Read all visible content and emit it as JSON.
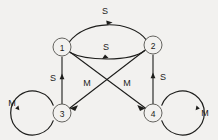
{
  "diagram": {
    "type": "directed-state-transition-graph",
    "background_color": "#f2f1ef",
    "line_color": "#1d1d1b",
    "node_fill_color": "#f2f1ef",
    "node_stroke_color": "#55544f",
    "nodes": [
      {
        "id": "1",
        "label": "1",
        "cx": 62,
        "cy": 47,
        "r": 9
      },
      {
        "id": "2",
        "label": "2",
        "cx": 153,
        "cy": 45,
        "r": 9
      },
      {
        "id": "3",
        "label": "3",
        "cx": 62,
        "cy": 113,
        "r": 9
      },
      {
        "id": "4",
        "label": "4",
        "cx": 153,
        "cy": 113,
        "r": 9
      }
    ],
    "edges": [
      {
        "id": "e-1-2-top",
        "from": "1",
        "to": "2",
        "label": "S",
        "label_x": 105,
        "label_y": 11,
        "shape": "curve-up"
      },
      {
        "id": "e-2-1-mid",
        "from": "2",
        "to": "1",
        "label": "S",
        "label_x": 106,
        "label_y": 47,
        "shape": "curve-down"
      },
      {
        "id": "e-3-1",
        "from": "3",
        "to": "1",
        "label": "S",
        "label_x": 53,
        "label_y": 78,
        "shape": "straight-vertical"
      },
      {
        "id": "e-4-2",
        "from": "4",
        "to": "2",
        "label": "S",
        "label_x": 163,
        "label_y": 77,
        "shape": "straight-vertical"
      },
      {
        "id": "e-1-4",
        "from": "1",
        "to": "4",
        "label": "M",
        "label_x": 127,
        "label_y": 83,
        "shape": "straight-diagonal"
      },
      {
        "id": "e-2-3",
        "from": "2",
        "to": "3",
        "label": "M",
        "label_x": 87,
        "label_y": 83,
        "shape": "straight-diagonal"
      }
    ],
    "self_loops": [
      {
        "id": "loop-3",
        "node": "3",
        "label": "M",
        "label_x": 12,
        "label_y": 103,
        "side": "left",
        "cx": 37,
        "cy": 113,
        "r": 22
      },
      {
        "id": "loop-4",
        "node": "4",
        "label": "M",
        "label_x": 205,
        "label_y": 113,
        "side": "right",
        "cx": 178,
        "cy": 113,
        "r": 22
      }
    ],
    "legend": {
      "symbols": [
        "S",
        "M"
      ]
    }
  }
}
